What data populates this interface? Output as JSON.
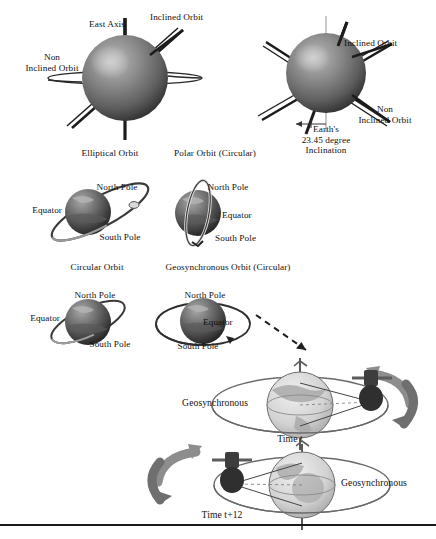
{
  "figure": {
    "background": "#ffffff",
    "ink": "#111111"
  },
  "palette": {
    "globe_dark_light": "#9a9a9a",
    "globe_dark_mid": "#6e6e6e",
    "globe_dark_shadow": "#2b2b2b",
    "globe_light_fill": "#d8d8d8",
    "globe_light_land": "#a9a9a9",
    "orbit_line": "#2a2a2a",
    "arrow_gray": "#8d8d8d",
    "ellipse_thin": "#555555"
  },
  "row1": {
    "left_globe": {
      "labels": {
        "east_axis": "East Axis",
        "inclined_orbit": "Inclined Orbit",
        "non_inclined_orbit": "Non\nInclined Orbit"
      },
      "caption": "Elliptical Orbit"
    },
    "right_globe": {
      "labels": {
        "inclined_orbit": "Inclined Orbit",
        "non_inclined_orbit": "Non\nInclined Orbit",
        "inclination": "Earth's\n23.45 degree\nInclination"
      }
    },
    "center_caption": "Polar Orbit (Circular)"
  },
  "row2": {
    "left_globe": {
      "north_pole": "North Pole",
      "equator": "Equator",
      "south_pole": "South Pole"
    },
    "right_globe": {
      "north_pole": "North Pole",
      "equator": "Equator",
      "south_pole": "South Pole"
    },
    "caption_left": "Circular Orbit",
    "caption_right": "Geosynchronous Orbit (Circular)"
  },
  "row3": {
    "left_globe": {
      "north_pole": "North Pole",
      "equator": "Equator",
      "south_pole": "South Pole"
    },
    "right_globe": {
      "north_pole": "North Pole",
      "equator": "Equator",
      "south_pole": "South Pole"
    }
  },
  "geo_panel_top": {
    "label": "Geosynchronous",
    "time": "Time t"
  },
  "geo_panel_bottom": {
    "label": "Geosynchronous",
    "time": "Time t+12"
  }
}
